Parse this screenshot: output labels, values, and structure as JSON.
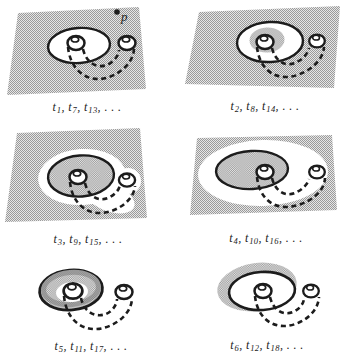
{
  "figure": {
    "type": "six-panel-sequence-diagram",
    "ellipsis": ". . ."
  },
  "colors": {
    "ink": "#1c1c1c",
    "paper": "#ffffff",
    "stipple_dark": "#9a9a9a",
    "stipple_light": "#e6e6e6",
    "rim_shadow": "#9b9b9b"
  },
  "panels": [
    {
      "id": 1,
      "scene": "stippled-plane-with-white-disk-and-dashed-tube",
      "point_label": "p",
      "label": {
        "var": "t",
        "subs": [
          "1",
          "7",
          "13"
        ],
        "plain": "t1, t7, t13, . . ."
      }
    },
    {
      "id": 2,
      "scene": "stippled-plane-white-disk-with-inner-stippled-blob",
      "label": {
        "var": "t",
        "subs": [
          "2",
          "8",
          "14"
        ],
        "plain": "t2, t8, t14, . . ."
      }
    },
    {
      "id": 3,
      "scene": "stippled-plane-white-halo-around-stippled-disk",
      "label": {
        "var": "t",
        "subs": [
          "3",
          "9",
          "15"
        ],
        "plain": "t3, t9, t15, . . ."
      }
    },
    {
      "id": 4,
      "scene": "stippled-plane-large-white-region-with-stippled-disk",
      "label": {
        "var": "t",
        "subs": [
          "4",
          "10",
          "16"
        ],
        "plain": "t4, t10, t16, . . ."
      }
    },
    {
      "id": 5,
      "scene": "stippled-annulus-disk-with-dashed-tube-no-plane",
      "label": {
        "var": "t",
        "subs": [
          "5",
          "11",
          "17"
        ],
        "plain": "t5, t11, t17, . . ."
      }
    },
    {
      "id": 6,
      "scene": "white-disk-with-outer-stippled-halo-no-plane",
      "label": {
        "var": "t",
        "subs": [
          "6",
          "12",
          "18"
        ],
        "plain": "t6, t12, t18, . . ."
      }
    }
  ]
}
